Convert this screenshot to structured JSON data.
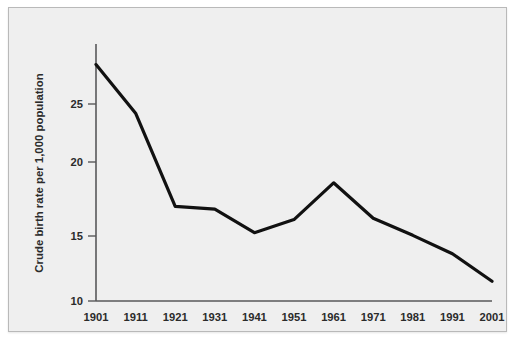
{
  "chart_data": {
    "type": "line",
    "title": "",
    "subtitle": "",
    "xlabel": "",
    "ylabel": "Crude birth rate per 1,000 population",
    "x": [
      1901,
      1911,
      1921,
      1931,
      1941,
      1951,
      1961,
      1971,
      1981,
      1991,
      2001
    ],
    "categories": [
      "1901",
      "1911",
      "1921",
      "1931",
      "1941",
      "1951",
      "1961",
      "1971",
      "1981",
      "1991",
      "2001"
    ],
    "values": [
      28.0,
      24.3,
      17.2,
      17.0,
      15.2,
      16.2,
      19.0,
      16.3,
      15.0,
      13.6,
      11.5
    ],
    "series": [
      {
        "name": "Crude birth rate",
        "values": [
          28.0,
          24.3,
          17.2,
          17.0,
          15.2,
          16.2,
          19.0,
          16.3,
          15.0,
          13.6,
          11.5
        ],
        "color": "#111111"
      }
    ],
    "xlim": [
      1901,
      2001
    ],
    "ylim": [
      10,
      29
    ],
    "x_ticks": [
      "1901",
      "1911",
      "1921",
      "1931",
      "1941",
      "1951",
      "1961",
      "1971",
      "1981",
      "1991",
      "2001"
    ],
    "y_ticks": [
      "10",
      "15",
      "20",
      "25"
    ],
    "y_tick_values": [
      10,
      15,
      20,
      25
    ],
    "grid": false,
    "legend": false,
    "legend_position": "none",
    "annotations": []
  },
  "figure": {
    "background_color": "#efefef",
    "border_color": "#b9b9b9",
    "axis_color": "#58585a",
    "line_color": "#111111",
    "text_color": "#2b2b2b"
  }
}
